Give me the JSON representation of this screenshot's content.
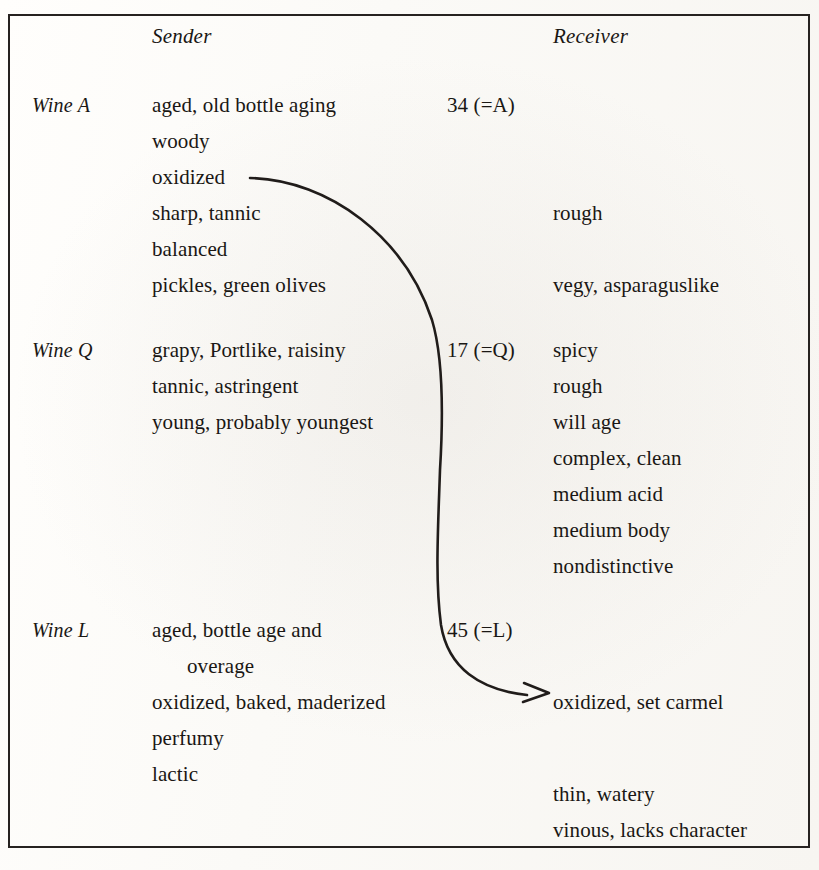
{
  "figure": {
    "columns": {
      "sender_header": "Sender",
      "receiver_header": "Receiver"
    },
    "wines": [
      {
        "label": "Wine A",
        "code": "34 (=A)",
        "sender": [
          "aged, old bottle aging",
          "woody",
          "oxidized",
          "sharp, tannic",
          "balanced",
          "pickles, green olives"
        ],
        "receiver": [
          "rough",
          "vegy, asparaguslike"
        ]
      },
      {
        "label": "Wine Q",
        "code": "17 (=Q)",
        "sender": [
          "grapy, Portlike, raisiny",
          "tannic, astringent",
          "young, probably youngest"
        ],
        "receiver": [
          "spicy",
          "rough",
          "will age",
          "complex, clean",
          "medium acid",
          "medium body",
          "nondistinctive"
        ]
      },
      {
        "label": "Wine L",
        "code": "45 (=L)",
        "sender": [
          "aged, bottle age and",
          "overage",
          "oxidized, baked, maderized",
          "perfumy",
          "lactic"
        ],
        "receiver": [
          "oxidized, set carmel",
          "thin, watery",
          "vinous, lacks character"
        ]
      }
    ],
    "annotation": {
      "arrow_name": "oxidized-link-arrow",
      "from_term": "oxidized",
      "to_term": "oxidized, set carmel",
      "stroke_color": "#201c1a"
    }
  }
}
